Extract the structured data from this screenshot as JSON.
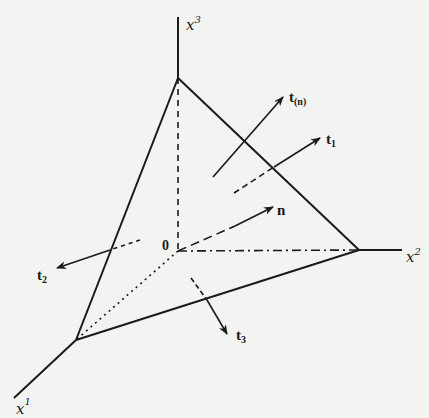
{
  "diagram": {
    "axes": {
      "x1": {
        "label": "x",
        "superscript": "1"
      },
      "x2": {
        "label": "x",
        "superscript": "2"
      },
      "x3": {
        "label": "x",
        "superscript": "3"
      }
    },
    "origin_label": "0",
    "vectors": {
      "tn": {
        "label": "t",
        "subscript": "(n)"
      },
      "t1": {
        "label": "t",
        "subscript": "1"
      },
      "t2": {
        "label": "t",
        "subscript": "2"
      },
      "t3": {
        "label": "t",
        "subscript": "3"
      },
      "n": {
        "label": "n"
      }
    },
    "colors": {
      "ink": "#1a1a1a",
      "paper": "#f3f3f1"
    }
  }
}
